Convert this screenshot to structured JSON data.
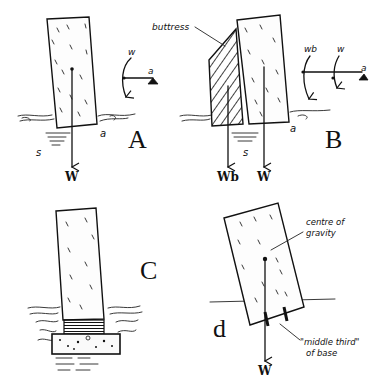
{
  "diagram": {
    "panels": [
      {
        "id": "A",
        "label": "A",
        "weight_label": "W",
        "settlement_label": "s",
        "pivot_label": "a",
        "moment_label": "w",
        "moment_pivot_label": "a"
      },
      {
        "id": "B",
        "label": "B",
        "buttress_label": "buttress",
        "weight_buttress_label": "Wb",
        "weight_label": "W",
        "settlement_label": "s",
        "pivot_label": "a",
        "moment_buttress_label": "wb",
        "moment_wall_label": "w",
        "moment_pivot_label": "a"
      },
      {
        "id": "C",
        "label": "C"
      },
      {
        "id": "d",
        "label": "d",
        "centre_of_gravity_label_line1": "centre of",
        "centre_of_gravity_label_line2": "gravity",
        "middle_third_label_line1": "\"middle third\"",
        "middle_third_label_line2": "of base",
        "weight_label": "W"
      }
    ]
  }
}
